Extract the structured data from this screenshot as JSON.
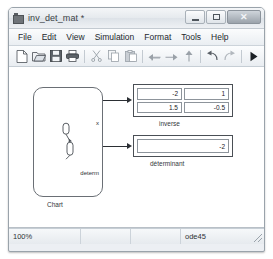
{
  "window": {
    "title": "inv_det_mat *",
    "app_icon": "simulink-model-icon",
    "controls": {
      "minimize": "minimize-icon",
      "maximize": "maximize-icon",
      "close": "close-icon"
    }
  },
  "menubar": {
    "items": [
      {
        "label": "File"
      },
      {
        "label": "Edit"
      },
      {
        "label": "View"
      },
      {
        "label": "Simulation"
      },
      {
        "label": "Format"
      },
      {
        "label": "Tools"
      },
      {
        "label": "Help"
      }
    ]
  },
  "toolbar": {
    "buttons": [
      {
        "name": "new-model-icon"
      },
      {
        "name": "open-folder-icon"
      },
      {
        "name": "save-disk-icon"
      },
      {
        "name": "print-icon"
      },
      {
        "name": "cut-scissors-icon"
      },
      {
        "name": "copy-icon"
      },
      {
        "name": "paste-icon"
      },
      {
        "name": "back-arrow-icon"
      },
      {
        "name": "forward-arrow-icon"
      },
      {
        "name": "up-arrow-icon"
      },
      {
        "name": "undo-icon"
      },
      {
        "name": "redo-icon"
      },
      {
        "name": "start-simulation-icon"
      }
    ]
  },
  "canvas": {
    "chart_block": {
      "caption": "Chart",
      "ports": [
        {
          "label": "x"
        },
        {
          "label": "determ"
        }
      ]
    },
    "inverse_display": {
      "caption": "inverse",
      "matrix": [
        [
          "-2",
          "1"
        ],
        [
          "1.5",
          "-0.5"
        ]
      ]
    },
    "determinant_display": {
      "caption": "déterminant",
      "value": "-2"
    }
  },
  "statusbar": {
    "zoom": "100%",
    "pane2": "",
    "pane3": "",
    "solver": "ode45"
  },
  "colors": {
    "window_chrome": "#eceff3",
    "canvas_bg": "#ffffff",
    "block_stroke": "#4a4f55",
    "wire": "#2b2f34"
  }
}
